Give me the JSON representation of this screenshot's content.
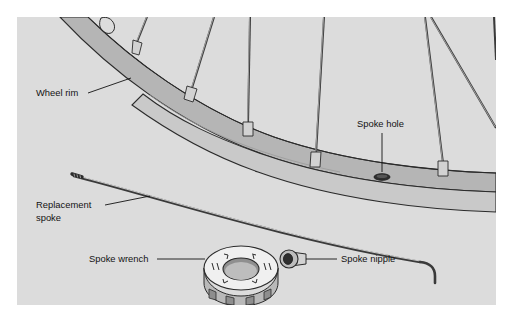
{
  "figure": {
    "type": "technical-illustration",
    "panel": {
      "x": 17,
      "y": 17,
      "width": 479,
      "height": 288,
      "background_color": "#dcdcdc",
      "outer_background_color": "#ffffff"
    },
    "colors": {
      "background": "#dcdcdc",
      "rim_upper_band": "#b5b5b5",
      "rim_lower_band": "#c9c9c9",
      "rim_inner_face": "#a8a8a8",
      "outline": "#2b2b2b",
      "spoke_fill": "#c2c2c2",
      "spoke_outline": "#3a3a3a",
      "nipple_fill": "#d2d2d2",
      "wrench_face": "#f0f0f0",
      "wrench_side": "#b9b9b9",
      "wrench_hole": "#8f8f8f",
      "spoke_hole_fill": "#2e2e2e",
      "label_text": "#131313",
      "leader_line": "#131313"
    }
  },
  "callouts": [
    {
      "id": "wheel-rim",
      "label": "Wheel rim",
      "lines": [
        "Wheel rim"
      ],
      "text_x": 36,
      "text_y": 96,
      "anchor": "start",
      "leader": {
        "x1": 88,
        "y1": 93,
        "x2": 131,
        "y2": 78
      }
    },
    {
      "id": "spoke-hole",
      "label": "Spoke hole",
      "lines": [
        "Spoke hole"
      ],
      "text_x": 357,
      "text_y": 127,
      "anchor": "start",
      "leader": {
        "x1": 382,
        "y1": 133,
        "x2": 382,
        "y2": 172
      }
    },
    {
      "id": "replacement-spoke",
      "label": "Replacement spoke",
      "lines": [
        "Replacement",
        "spoke"
      ],
      "text_x": 36,
      "text_y": 208,
      "anchor": "start",
      "leader": {
        "x1": 105,
        "y1": 205,
        "x2": 150,
        "y2": 196
      }
    },
    {
      "id": "spoke-wrench",
      "label": "Spoke wrench",
      "lines": [
        "Spoke wrench"
      ],
      "text_x": 89,
      "text_y": 262,
      "anchor": "start",
      "leader": {
        "x1": 157,
        "y1": 259,
        "x2": 205,
        "y2": 259
      }
    },
    {
      "id": "spoke-nipple",
      "label": "Spoke nipple",
      "lines": [
        "Spoke nipple"
      ],
      "text_x": 341,
      "text_y": 262,
      "anchor": "start",
      "leader": {
        "x1": 306,
        "y1": 259,
        "x2": 337,
        "y2": 259
      }
    }
  ],
  "parts": {
    "wheel_rim": {
      "name": "wheel-rim",
      "description": "Curved double-band bicycle wheel rim sweeping from upper left to right edge"
    },
    "spokes": {
      "name": "wheel-spokes",
      "count": 7,
      "description": "Spokes radiating upward from rim toward hub, each seated in a nipple at the rim"
    },
    "spoke_hole": {
      "name": "spoke-hole",
      "description": "Empty dark elliptical eyelet in the rim",
      "cx": 382,
      "cy": 177,
      "rx": 8,
      "ry": 3.2
    },
    "replacement_spoke": {
      "name": "replacement-spoke",
      "description": "Long straight spoke with threaded tip at left and J-bend elbow at right"
    },
    "spoke_wrench": {
      "name": "spoke-wrench",
      "description": "Round disc spoke wrench with central hole, radial slot markings and notched rim",
      "cx": 241,
      "cy": 268
    },
    "spoke_nipple": {
      "name": "spoke-nipple",
      "description": "Small threaded nipple with dark round head and cylindrical body",
      "cx": 291,
      "cy": 259
    }
  }
}
